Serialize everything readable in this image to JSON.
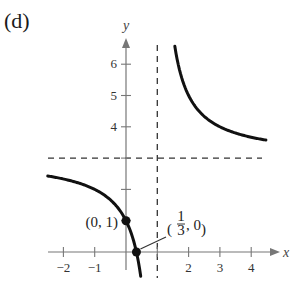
{
  "panel_label": "(d)",
  "colors": {
    "axis": "#777777",
    "curve": "#111111",
    "asymptote": "#333333",
    "text": "#333333"
  },
  "chart_data": {
    "type": "line",
    "title": "",
    "function": "f(x) = (3x - 1)/(x - 1) = 3 + 2/(x - 1)",
    "xlabel": "x",
    "ylabel": "y",
    "xlim": [
      -2.5,
      4.8
    ],
    "ylim": [
      -0.8,
      6.8
    ],
    "grid": false,
    "x_ticks": [
      -2,
      -1,
      1,
      2,
      3,
      4
    ],
    "x_tick_labels": [
      "−2",
      "−1",
      "",
      "2",
      "3",
      "4"
    ],
    "y_ticks": [
      1,
      2,
      3,
      4,
      5,
      6
    ],
    "y_tick_labels": [
      "",
      "",
      "",
      "4",
      "5",
      "6"
    ],
    "asymptotes": {
      "vertical": 1,
      "horizontal": 3
    },
    "series": [
      {
        "name": "left branch",
        "x_range": [
          -2.5,
          0.47
        ]
      },
      {
        "name": "right branch",
        "x_range": [
          1.56,
          4.47
        ]
      }
    ],
    "points": [
      {
        "x": 0,
        "y": 1,
        "label": "(0, 1)"
      },
      {
        "x": 0.3333,
        "y": 0,
        "label_num": "1",
        "label_den": "3",
        "label_rest": ", 0"
      }
    ]
  }
}
